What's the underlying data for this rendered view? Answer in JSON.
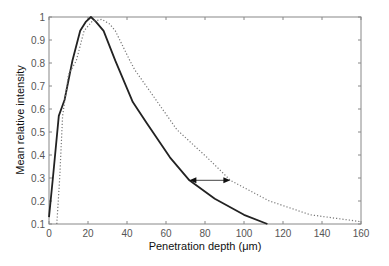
{
  "chart_data": {
    "type": "line",
    "title": "",
    "xlabel": "Penetration depth (μm)",
    "ylabel": "Mean relative intensity",
    "xlim": [
      0,
      160
    ],
    "ylim": [
      0.1,
      1.0
    ],
    "xticks": [
      0,
      20,
      40,
      60,
      80,
      100,
      120,
      140,
      160
    ],
    "yticks": [
      0.1,
      0.2,
      0.3,
      0.4,
      0.5,
      0.6,
      0.7,
      0.8,
      0.9,
      1
    ],
    "ytick_labels": [
      "0.1",
      "0.2",
      "0.3",
      "0.4",
      "0.5",
      "0.6",
      "0.7",
      "0.8",
      "0.9",
      "1"
    ],
    "grid": false,
    "legend": null,
    "series": [
      {
        "name": "solid",
        "style": "solid",
        "color": "#222222",
        "x": [
          0,
          2,
          5,
          8,
          12,
          16,
          19,
          21.5,
          24,
          28,
          34,
          43,
          50,
          62,
          72,
          85,
          100,
          112
        ],
        "y": [
          0.13,
          0.3,
          0.57,
          0.64,
          0.81,
          0.94,
          0.98,
          1.0,
          0.98,
          0.94,
          0.81,
          0.63,
          0.54,
          0.39,
          0.29,
          0.21,
          0.14,
          0.1
        ]
      },
      {
        "name": "dotted",
        "style": "dotted",
        "color": "#777777",
        "x": [
          4,
          5.5,
          7,
          10,
          14,
          18,
          22,
          27,
          31,
          34,
          41.5,
          44,
          54,
          65.6,
          81,
          93,
          113,
          134,
          160
        ],
        "y": [
          0.1,
          0.3,
          0.57,
          0.75,
          0.81,
          0.94,
          0.98,
          0.99,
          0.97,
          0.94,
          0.81,
          0.77,
          0.65,
          0.51,
          0.39,
          0.29,
          0.2,
          0.14,
          0.11
        ]
      }
    ],
    "annotations": [
      {
        "type": "double-arrow",
        "x1": 72,
        "x2": 93,
        "y": 0.29
      }
    ]
  }
}
